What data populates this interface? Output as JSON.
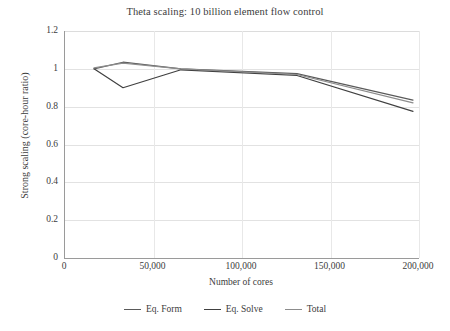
{
  "chart_data": {
    "type": "line",
    "title": "Theta scaling: 10 billion element flow control",
    "xlabel": "Number of cores",
    "ylabel": "Strong scaling (core-hour ratio)",
    "xlim": [
      0,
      200000
    ],
    "ylim": [
      0,
      1.2
    ],
    "xticks": [
      "0",
      "50,000",
      "100,000",
      "150,000",
      "200,000"
    ],
    "xtick_values": [
      0,
      50000,
      100000,
      150000,
      200000
    ],
    "yticks": [
      "0",
      "0.2",
      "0.4",
      "0.6",
      "0.8",
      "1",
      "1.2"
    ],
    "ytick_values": [
      0,
      0.2,
      0.4,
      0.6,
      0.8,
      1,
      1.2
    ],
    "grid": "horizontal-and-vertical",
    "legend_position": "bottom",
    "x": [
      16384,
      32768,
      65536,
      131072,
      196608
    ],
    "series": [
      {
        "name": "Eq. Form",
        "color": "#5a5a5a",
        "values": [
          1.0,
          1.035,
          1.0,
          0.975,
          0.835
        ]
      },
      {
        "name": "Eq. Solve",
        "color": "#404040",
        "values": [
          1.0,
          0.9,
          0.995,
          0.965,
          0.775
        ]
      },
      {
        "name": "Total",
        "color": "#8c8c8c",
        "values": [
          1.005,
          1.03,
          1.0,
          0.97,
          0.82
        ]
      }
    ]
  }
}
